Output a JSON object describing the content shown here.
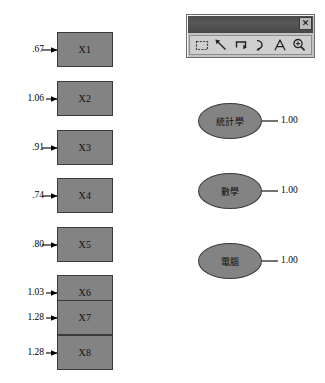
{
  "diagram": {
    "type": "sem-path-diagram",
    "observed_variables": [
      {
        "label": "X1",
        "error_variance": ".67"
      },
      {
        "label": "X2",
        "error_variance": "1.06"
      },
      {
        "label": "X3",
        "error_variance": ".91"
      },
      {
        "label": "X4",
        "error_variance": ".74"
      },
      {
        "label": "X5",
        "error_variance": ".80"
      },
      {
        "label": "X6",
        "error_variance": "1.03"
      },
      {
        "label": "X7",
        "error_variance": "1.28"
      },
      {
        "label": "X8",
        "error_variance": "1.28"
      }
    ],
    "latent_variables": [
      {
        "label": "統計學",
        "loading": "1.00"
      },
      {
        "label": "數學",
        "loading": "1.00"
      },
      {
        "label": "電腦",
        "loading": "1.00"
      }
    ],
    "colors": {
      "node_fill": "#838383",
      "node_border": "#3a3a3a",
      "background": "#ffffff",
      "connector": "#000000"
    }
  },
  "toolbar": {
    "close_label": "✕",
    "tools": [
      {
        "name": "rectangle-tool",
        "title": "Rectangle"
      },
      {
        "name": "line-tool",
        "title": "Line"
      },
      {
        "name": "polyline-tool",
        "title": "Polyline"
      },
      {
        "name": "curve-tool",
        "title": "Curve"
      },
      {
        "name": "text-tool",
        "title": "Text"
      },
      {
        "name": "zoom-tool",
        "title": "Zoom"
      }
    ]
  }
}
